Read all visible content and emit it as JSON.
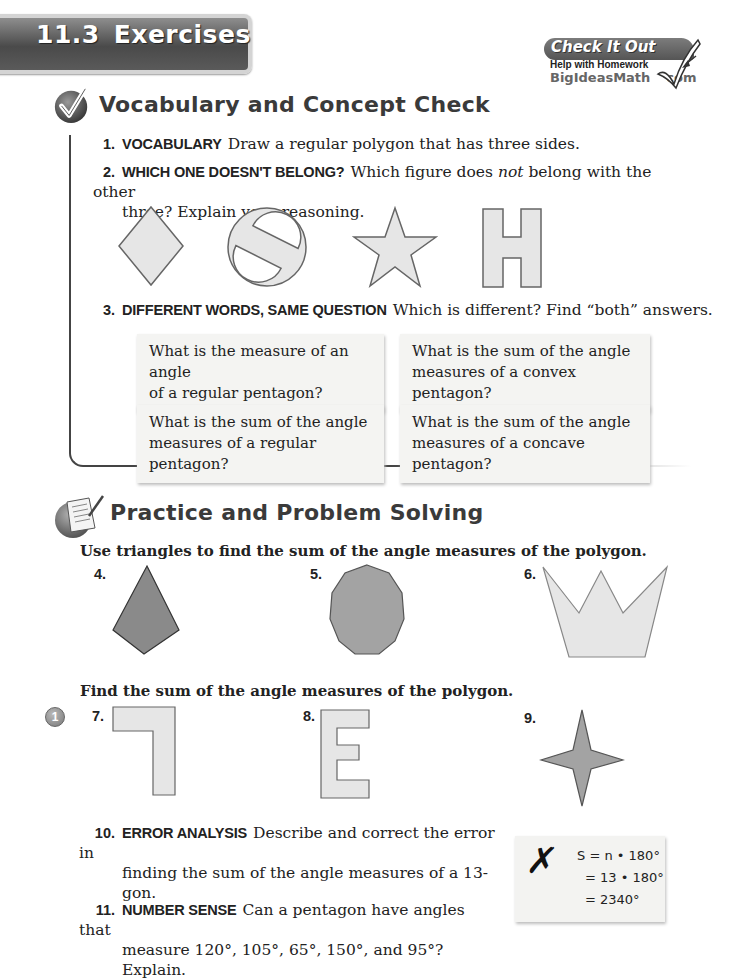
{
  "header": {
    "section_number": "11.3",
    "section_title": "Exercises"
  },
  "logo": {
    "title": "Check It Out",
    "subtitle": "Help with Homework",
    "site_name": "BigIdeasMath",
    "site_tld": "com"
  },
  "vocab_section": {
    "title": "Vocabulary and Concept Check",
    "icon": "checkmark-circle-icon",
    "questions": [
      {
        "number": "1.",
        "keyword": "VOCABULARY",
        "text": "Draw a regular polygon that has three sides."
      },
      {
        "number": "2.",
        "keyword": "WHICH ONE DOESN'T BELONG?",
        "text_before": "Which figure does",
        "text_italic": "not",
        "text_after": "belong with the other",
        "text_line2": "three? Explain your reasoning.",
        "figures": [
          "rhombus",
          "circle-with-slash",
          "five-point-star",
          "letter-H-shape"
        ]
      },
      {
        "number": "3.",
        "keyword": "DIFFERENT WORDS, SAME QUESTION",
        "text": "Which is different? Find “both” answers.",
        "cards": [
          {
            "line1": "What is the measure of an angle",
            "line2": "of a regular pentagon?"
          },
          {
            "line1": "What is the sum of the angle",
            "line2": "measures of a convex pentagon?"
          },
          {
            "line1": "What is the sum of the angle",
            "line2": "measures of a regular pentagon?"
          },
          {
            "line1": "What is the sum of the angle",
            "line2": "measures of a concave pentagon?"
          }
        ]
      }
    ]
  },
  "practice_section": {
    "title": "Practice and Problem Solving",
    "icon": "homework-paper-pencil-icon",
    "instruction_1": "Use triangles to find the sum of the angle measures of the polygon.",
    "problems_1": [
      {
        "number": "4.",
        "shape": "kite"
      },
      {
        "number": "5.",
        "shape": "decagon"
      },
      {
        "number": "6.",
        "shape": "crown"
      }
    ],
    "instruction_2": "Find the sum of the angle measures of the polygon.",
    "example_badge": "1",
    "problems_2": [
      {
        "number": "7.",
        "shape": "seven-shape"
      },
      {
        "number": "8.",
        "shape": "letter-E-shape"
      },
      {
        "number": "9.",
        "shape": "four-point-star"
      }
    ],
    "q10": {
      "number": "10.",
      "keyword": "ERROR ANALYSIS",
      "text_line1": "Describe and correct the error in",
      "text_line2": "finding the sum of the angle measures of a 13-gon."
    },
    "error_card": {
      "mark": "✗",
      "line1": "S = n • 180°",
      "line2": "= 13 • 180°",
      "line3": "= 2340°"
    },
    "q11": {
      "number": "11.",
      "keyword": "NUMBER SENSE",
      "text_line1": "Can a pentagon have angles that",
      "text_line2": "measure 120°, 105°, 65°, 150°, and 95°? Explain."
    }
  },
  "colors": {
    "banner": "#5a5a5a",
    "shape_light": "#e6e6e6",
    "shape_dark": "#8a8a8a",
    "shape_stroke": "#555555"
  }
}
